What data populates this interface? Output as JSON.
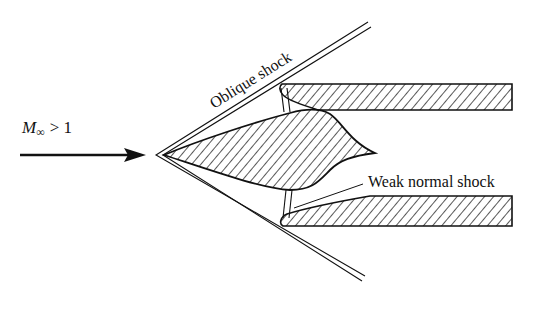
{
  "diagram": {
    "type": "supersonic-inlet-schematic",
    "freestream_label": {
      "symbol": "M",
      "subscript": "∞",
      "relation": "> 1"
    },
    "labels": {
      "oblique_shock": "Oblique shock",
      "weak_normal_shock": "Weak normal shock"
    },
    "colors": {
      "ink": "#111111",
      "background": "#ffffff"
    }
  }
}
